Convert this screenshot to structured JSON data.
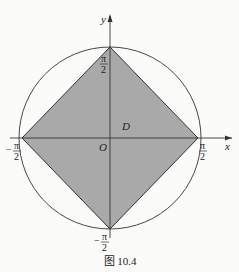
{
  "figure": {
    "caption": "图 10.4",
    "axes": {
      "x_label": "x",
      "y_label": "y",
      "origin_label": "O"
    },
    "region_label": "D",
    "tick_labels": {
      "top": {
        "num": "π",
        "den": "2",
        "sign": ""
      },
      "bottom": {
        "num": "π",
        "den": "2",
        "sign": "−"
      },
      "left": {
        "num": "π",
        "den": "2",
        "sign": "−"
      },
      "right": {
        "num": "π",
        "den": "2",
        "sign": ""
      }
    },
    "colors": {
      "fill": "#a9a9a9",
      "stroke": "#333333",
      "background": "#fbfbf9"
    }
  }
}
